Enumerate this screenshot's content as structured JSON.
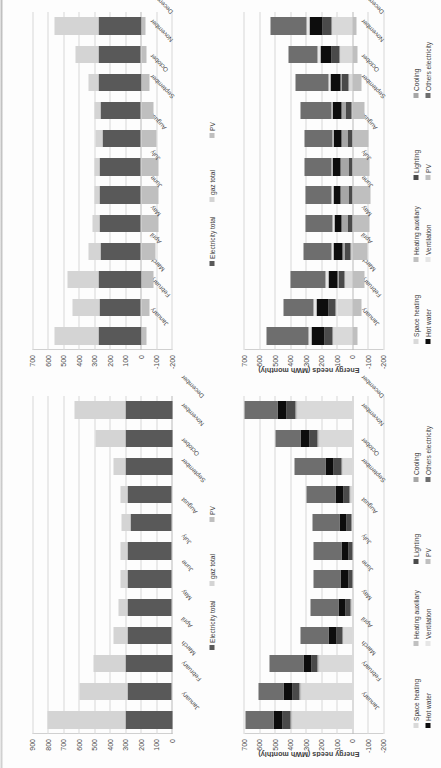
{
  "document": {
    "kind": "scanned-page-four-bar-charts",
    "orientation_note": "page rotated 90 degrees counter-clockwise",
    "background": "#fdfdfd",
    "scan_edge_color": "#c2c2c2"
  },
  "palette": {
    "electricity_total": "#595959",
    "gaz_total": "#d4d4d4",
    "pv": "#bfbfbf",
    "space_heating": "#d9d9d9",
    "heating_auxiliary": "#c0c0c0",
    "lighting": "#4a4a4a",
    "cooling": "#a6a6a6",
    "hot_water": "#0d0d0d",
    "ventilation": "#e6e6e6",
    "others_electricity": "#6e6e6e",
    "gridline": "#d8d8d8",
    "axis": "#c0c0c0",
    "text": "#3d3d3d"
  },
  "months": [
    "January",
    "February",
    "March",
    "April",
    "May",
    "June",
    "July",
    "August",
    "September",
    "October",
    "November",
    "December"
  ],
  "chart_data": [
    {
      "id": "top-left-totals",
      "panel": "upper-left",
      "type": "bar",
      "stacked": true,
      "orientation": "vertical",
      "title": "",
      "xlabel": "",
      "ylabel": "",
      "ylim": [
        0,
        900
      ],
      "yticks": [
        0,
        100,
        200,
        300,
        400,
        500,
        600,
        700,
        800,
        900
      ],
      "grid": true,
      "legend_position": "bottom",
      "categories": [
        "January",
        "February",
        "March",
        "April",
        "May",
        "June",
        "July",
        "August",
        "September",
        "October",
        "November",
        "December"
      ],
      "series": [
        {
          "name": "Electricity total",
          "color": "#595959",
          "values": [
            300,
            290,
            300,
            285,
            290,
            290,
            290,
            270,
            285,
            300,
            300,
            300
          ]
        },
        {
          "name": "gaz total",
          "color": "#d4d4d4",
          "values": [
            505,
            310,
            205,
            90,
            55,
            40,
            40,
            55,
            45,
            75,
            195,
            330
          ]
        },
        {
          "name": "PV",
          "color": "#bfbfbf",
          "values": [
            0,
            0,
            0,
            0,
            0,
            0,
            0,
            0,
            0,
            0,
            0,
            0
          ]
        }
      ],
      "totals": [
        805,
        600,
        505,
        375,
        345,
        330,
        330,
        325,
        330,
        375,
        495,
        630
      ]
    },
    {
      "id": "top-right-totals",
      "panel": "upper-right",
      "type": "bar",
      "stacked": true,
      "orientation": "vertical",
      "title": "",
      "xlabel": "",
      "ylabel": "",
      "ylim": [
        -200,
        700
      ],
      "yticks": [
        -200,
        -100,
        0,
        100,
        200,
        300,
        400,
        500,
        600,
        700
      ],
      "grid": true,
      "legend_position": "bottom",
      "categories": [
        "January",
        "February",
        "March",
        "April",
        "May",
        "June",
        "July",
        "August",
        "September",
        "October",
        "November",
        "December"
      ],
      "series": [
        {
          "name": "Electricity total",
          "color": "#595959",
          "values": [
            275,
            265,
            275,
            262,
            268,
            265,
            265,
            248,
            262,
            275,
            272,
            275
          ]
        },
        {
          "name": "gaz total",
          "color": "#d4d4d4",
          "values": [
            280,
            175,
            200,
            78,
            45,
            35,
            38,
            48,
            38,
            62,
            152,
            280
          ]
        },
        {
          "name": "PV",
          "color": "#bfbfbf",
          "values": [
            -35,
            -55,
            -80,
            -95,
            -110,
            -115,
            -112,
            -100,
            -78,
            -55,
            -35,
            -28
          ]
        }
      ],
      "totals": [
        520,
        385,
        395,
        245,
        203,
        185,
        191,
        196,
        222,
        282,
        389,
        527
      ]
    },
    {
      "id": "bottom-left-needs",
      "panel": "lower-left",
      "type": "bar",
      "stacked": true,
      "orientation": "vertical",
      "title": "",
      "xlabel": "",
      "ylabel": "Energy needs (MWh monthly)",
      "ylim": [
        -200,
        700
      ],
      "yticks": [
        -200,
        -100,
        0,
        100,
        200,
        300,
        400,
        500,
        600,
        700
      ],
      "grid": true,
      "legend_position": "bottom",
      "categories": [
        "January",
        "February",
        "March",
        "April",
        "May",
        "June",
        "July",
        "August",
        "September",
        "October",
        "November",
        "December"
      ],
      "series": [
        {
          "name": "Space heating",
          "color": "#d9d9d9",
          "values": [
            385,
            330,
            215,
            60,
            10,
            0,
            0,
            5,
            18,
            70,
            215,
            355
          ]
        },
        {
          "name": "Heating auxiliary",
          "color": "#c0c0c0",
          "values": [
            12,
            10,
            8,
            5,
            2,
            0,
            0,
            0,
            2,
            4,
            8,
            12
          ]
        },
        {
          "name": "Lighting",
          "color": "#4a4a4a",
          "values": [
            55,
            48,
            40,
            36,
            30,
            28,
            28,
            32,
            38,
            46,
            52,
            58
          ]
        },
        {
          "name": "Cooling",
          "color": "#a6a6a6",
          "values": [
            0,
            0,
            0,
            0,
            0,
            0,
            0,
            0,
            0,
            0,
            0,
            0
          ]
        },
        {
          "name": "Hot water",
          "color": "#0d0d0d",
          "values": [
            60,
            58,
            55,
            52,
            50,
            48,
            46,
            48,
            52,
            55,
            58,
            60
          ]
        },
        {
          "name": "Ventilation",
          "color": "#e6e6e6",
          "values": [
            0,
            0,
            0,
            0,
            0,
            0,
            0,
            0,
            0,
            0,
            0,
            0
          ]
        },
        {
          "name": "PV",
          "color": "#bfbfbf",
          "values": [
            0,
            0,
            0,
            0,
            0,
            0,
            0,
            0,
            0,
            0,
            0,
            0
          ]
        },
        {
          "name": "Others electricity",
          "color": "#6e6e6e",
          "values": [
            180,
            160,
            215,
            185,
            180,
            175,
            178,
            175,
            188,
            200,
            165,
            210
          ]
        }
      ],
      "totals": [
        692,
        606,
        533,
        338,
        272,
        251,
        252,
        260,
        298,
        375,
        498,
        695
      ]
    },
    {
      "id": "bottom-right-needs",
      "panel": "lower-right",
      "type": "bar",
      "stacked": true,
      "orientation": "vertical",
      "title": "",
      "xlabel": "",
      "ylabel": "Energy needs (MWh monthly)",
      "ylim": [
        -200,
        700
      ],
      "yticks": [
        -200,
        -100,
        0,
        100,
        200,
        300,
        400,
        500,
        600,
        700
      ],
      "grid": true,
      "legend_position": "bottom",
      "categories": [
        "January",
        "February",
        "March",
        "April",
        "May",
        "June",
        "July",
        "August",
        "September",
        "October",
        "November",
        "December"
      ],
      "series": [
        {
          "name": "Space heating",
          "color": "#d9d9d9",
          "values": [
            120,
            100,
            45,
            12,
            2,
            0,
            0,
            0,
            5,
            20,
            80,
            128
          ]
        },
        {
          "name": "Heating auxiliary",
          "color": "#c0c0c0",
          "values": [
            8,
            7,
            5,
            3,
            1,
            0,
            0,
            0,
            1,
            3,
            6,
            9
          ]
        },
        {
          "name": "Lighting",
          "color": "#4a4a4a",
          "values": [
            52,
            46,
            40,
            34,
            30,
            28,
            28,
            32,
            38,
            46,
            50,
            55
          ]
        },
        {
          "name": "Cooling",
          "color": "#a6a6a6",
          "values": [
            0,
            0,
            5,
            18,
            35,
            48,
            52,
            42,
            28,
            10,
            0,
            0
          ]
        },
        {
          "name": "Hot water",
          "color": "#0d0d0d",
          "values": [
            85,
            80,
            62,
            55,
            50,
            48,
            46,
            48,
            54,
            62,
            72,
            84
          ]
        },
        {
          "name": "Ventilation",
          "color": "#e6e6e6",
          "values": [
            18,
            16,
            14,
            12,
            10,
            10,
            10,
            10,
            12,
            14,
            16,
            18
          ]
        },
        {
          "name": "PV",
          "color": "#bfbfbf",
          "values": [
            -35,
            -55,
            -80,
            -95,
            -110,
            -115,
            -112,
            -100,
            -78,
            -55,
            -35,
            -28
          ]
        },
        {
          "name": "Others electricity",
          "color": "#6e6e6e",
          "values": [
            270,
            195,
            230,
            180,
            178,
            172,
            175,
            175,
            195,
            215,
            190,
            235
          ]
        }
      ],
      "totals": [
        518,
        389,
        321,
        219,
        196,
        191,
        199,
        207,
        255,
        315,
        379,
        501
      ]
    }
  ],
  "legends": {
    "totals": [
      {
        "label": "Electricity total",
        "color": "#595959"
      },
      {
        "label": "gaz total",
        "color": "#d4d4d4"
      },
      {
        "label": "PV",
        "color": "#bfbfbf"
      }
    ],
    "needs": [
      {
        "label": "Space heating",
        "color": "#d9d9d9"
      },
      {
        "label": "Heating auxiliary",
        "color": "#c0c0c0"
      },
      {
        "label": "Lighting",
        "color": "#4a4a4a"
      },
      {
        "label": "Cooling",
        "color": "#a6a6a6"
      },
      {
        "label": "Hot water",
        "color": "#0d0d0d"
      },
      {
        "label": "Ventilation",
        "color": "#e6e6e6"
      },
      {
        "label": "PV",
        "color": "#bfbfbf"
      },
      {
        "label": "Others electricity",
        "color": "#6e6e6e"
      }
    ]
  }
}
